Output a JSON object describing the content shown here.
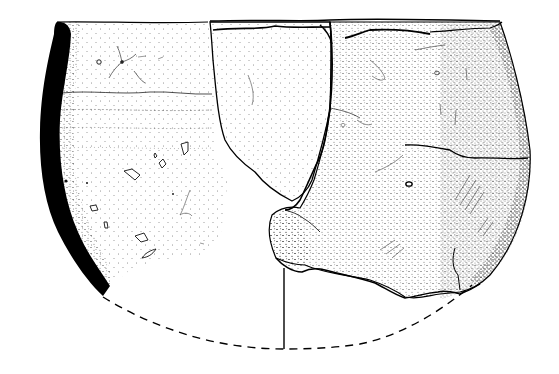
{
  "figure": {
    "type": "archaeological pottery drawing",
    "components": {
      "profile_section": {
        "description": "solid black wall cross-section on left side",
        "fill": "#000000"
      },
      "left_half": {
        "description": "interior-surface rendering with stippling and inclusions"
      },
      "right_half": {
        "description": "exterior view of joined sherds with cracks and stippling"
      },
      "axis_line": {
        "description": "vertical center axis from base of sherds to reconstructed base"
      },
      "reconstruction": {
        "description": "dashed line indicating reconstructed missing base contour",
        "style": "dashed"
      }
    },
    "colors": {
      "ink": "#000000",
      "paper": "#ffffff",
      "stipple": "#1a1a1a"
    },
    "text_labels": []
  }
}
